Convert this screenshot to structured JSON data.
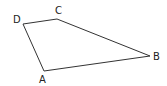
{
  "diagram": {
    "type": "quadrilateral",
    "stroke_color": "#333333",
    "vertices": [
      {
        "name": "A",
        "x": 44,
        "y": 71,
        "label_x": 39,
        "label_y": 83
      },
      {
        "name": "B",
        "x": 150,
        "y": 56,
        "label_x": 153,
        "label_y": 60
      },
      {
        "name": "C",
        "x": 57,
        "y": 19,
        "label_x": 55,
        "label_y": 14
      },
      {
        "name": "D",
        "x": 23,
        "y": 24,
        "label_x": 13,
        "label_y": 23
      }
    ],
    "edges": [
      [
        "A",
        "B"
      ],
      [
        "B",
        "C"
      ],
      [
        "C",
        "D"
      ],
      [
        "D",
        "A"
      ]
    ]
  }
}
